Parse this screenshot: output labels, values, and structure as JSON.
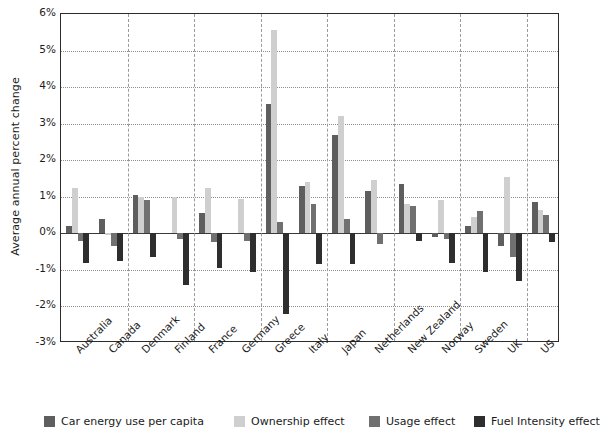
{
  "chart_data": {
    "type": "bar",
    "title": "",
    "xlabel": "",
    "ylabel": "Average annual percent change",
    "ylim": [
      -3,
      6
    ],
    "ytick_labels": [
      "6%",
      "5%",
      "4%",
      "3%",
      "2%",
      "1%",
      "0%",
      "-1%",
      "-2%",
      "-3%"
    ],
    "ytick_values": [
      6,
      5,
      4,
      3,
      2,
      1,
      0,
      -1,
      -2,
      -3
    ],
    "grid": "horizontal-dotted-with-vertical-dashed-group-separators",
    "legend_position": "bottom",
    "categories": [
      "Australia",
      "Canada",
      "Denmark",
      "Finland",
      "France",
      "Germany",
      "Greece",
      "Italy",
      "Japan",
      "Netherlands",
      "New Zealand",
      "Norway",
      "Sweden",
      "UK",
      "US"
    ],
    "series": [
      {
        "name": "Car energy use per capita",
        "color": "#5e5e5e",
        "values": [
          0.2,
          0.4,
          1.05,
          0.0,
          0.55,
          0.0,
          3.55,
          1.3,
          2.7,
          1.15,
          1.35,
          -0.1,
          0.2,
          -0.35,
          0.85
        ]
      },
      {
        "name": "Ownership effect",
        "color": "#cfcfcf",
        "values": [
          1.25,
          -0.05,
          1.0,
          1.0,
          1.25,
          0.95,
          5.55,
          1.4,
          3.2,
          1.45,
          0.8,
          0.9,
          0.45,
          1.55,
          0.65
        ]
      },
      {
        "name": "Usage effect",
        "color": "#707070",
        "values": [
          -0.2,
          -0.35,
          0.9,
          -0.15,
          -0.25,
          -0.2,
          0.3,
          0.8,
          0.4,
          -0.3,
          0.75,
          -0.15,
          0.6,
          -0.65,
          0.5
        ]
      },
      {
        "name": "Fuel Intensity effect",
        "color": "#2e2e2e",
        "values": [
          -0.8,
          -0.75,
          -0.65,
          -1.4,
          -0.95,
          -1.05,
          -2.2,
          -0.85,
          -0.85,
          0.0,
          -0.2,
          -0.8,
          -1.05,
          -1.3,
          -0.25
        ]
      }
    ]
  },
  "legend": {
    "items": [
      {
        "label": "Car energy use per capita",
        "color": "#5e5e5e"
      },
      {
        "label": "Ownership effect",
        "color": "#cfcfcf"
      },
      {
        "label": "Usage effect",
        "color": "#707070"
      },
      {
        "label": "Fuel Intensity effect",
        "color": "#2e2e2e"
      }
    ]
  }
}
